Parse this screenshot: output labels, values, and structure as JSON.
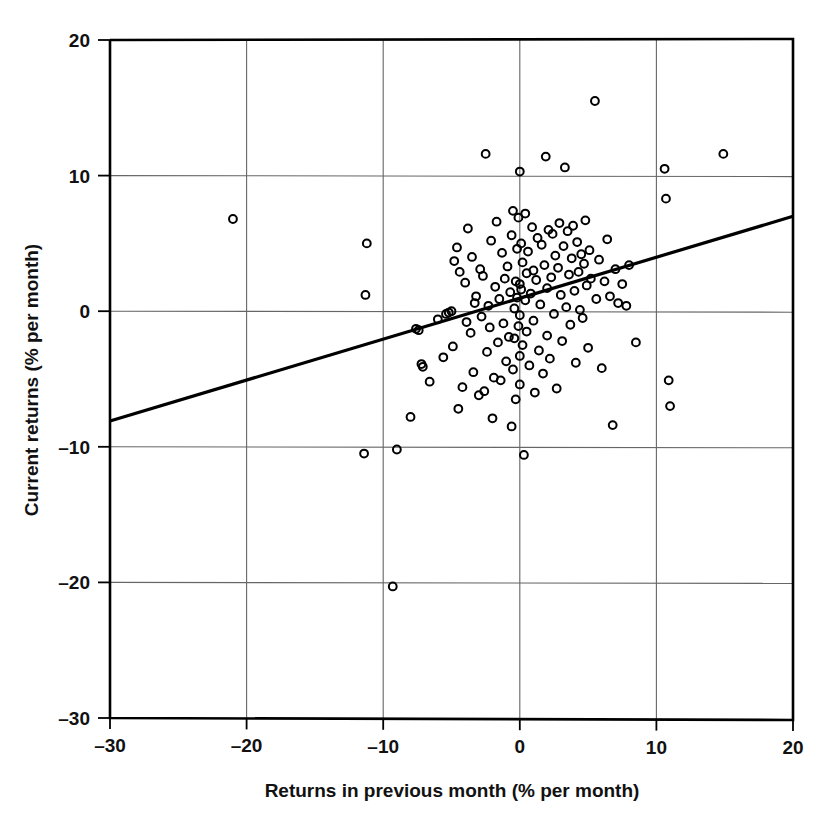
{
  "chart_data": {
    "type": "scatter",
    "title": "",
    "xlabel": "Returns in previous month (% per month)",
    "ylabel": "Current returns (% per month)",
    "xlim": [
      -30,
      20
    ],
    "ylim": [
      -30,
      20
    ],
    "xticks": [
      -30,
      -20,
      -10,
      0,
      10,
      20
    ],
    "yticks": [
      -30,
      -20,
      -10,
      0,
      10,
      20
    ],
    "xtick_labels": [
      "–30",
      "–20",
      "–10",
      "0",
      "10",
      "20"
    ],
    "ytick_labels": [
      "–30",
      "–20",
      "–10",
      "0",
      "10",
      "20"
    ],
    "grid": true,
    "grid_color": "#666666",
    "axis_color": "#000000",
    "marker": "open-circle",
    "marker_color": "#000000",
    "marker_size": 8,
    "legend": "none",
    "series": [
      {
        "name": "Monthly returns",
        "points": [
          [
            -21.0,
            6.8
          ],
          [
            -11.2,
            5.0
          ],
          [
            -11.3,
            1.2
          ],
          [
            -11.4,
            -10.5
          ],
          [
            -9.3,
            -20.3
          ],
          [
            -9.0,
            -10.2
          ],
          [
            -8.0,
            -7.8
          ],
          [
            -7.6,
            -1.3
          ],
          [
            -7.4,
            -1.4
          ],
          [
            -7.2,
            -3.9
          ],
          [
            -7.1,
            -4.1
          ],
          [
            -6.6,
            -5.2
          ],
          [
            -6.0,
            -0.6
          ],
          [
            -5.6,
            -3.4
          ],
          [
            -5.4,
            -0.2
          ],
          [
            -5.2,
            -0.1
          ],
          [
            -5.0,
            0.0
          ],
          [
            -4.9,
            -2.6
          ],
          [
            -4.8,
            3.7
          ],
          [
            -4.6,
            4.7
          ],
          [
            -4.5,
            -7.2
          ],
          [
            -4.4,
            2.9
          ],
          [
            -4.2,
            -5.6
          ],
          [
            -4.0,
            2.1
          ],
          [
            -3.9,
            -0.8
          ],
          [
            -3.8,
            6.1
          ],
          [
            -3.6,
            -1.6
          ],
          [
            -3.5,
            4.0
          ],
          [
            -3.4,
            -4.5
          ],
          [
            -3.3,
            0.6
          ],
          [
            -3.2,
            1.1
          ],
          [
            -3.0,
            -6.2
          ],
          [
            -2.9,
            3.1
          ],
          [
            -2.8,
            -0.4
          ],
          [
            -2.7,
            2.6
          ],
          [
            -2.6,
            -5.9
          ],
          [
            -2.5,
            11.6
          ],
          [
            -2.4,
            -3.0
          ],
          [
            -2.3,
            0.4
          ],
          [
            -2.2,
            -1.2
          ],
          [
            -2.1,
            5.2
          ],
          [
            -2.0,
            -7.9
          ],
          [
            -1.9,
            -4.9
          ],
          [
            -1.8,
            1.8
          ],
          [
            -1.7,
            6.6
          ],
          [
            -1.6,
            -2.3
          ],
          [
            -1.5,
            0.9
          ],
          [
            -1.4,
            -5.1
          ],
          [
            -1.3,
            4.3
          ],
          [
            -1.2,
            -0.9
          ],
          [
            -1.1,
            2.4
          ],
          [
            -1.0,
            -3.7
          ],
          [
            -0.9,
            3.3
          ],
          [
            -0.8,
            -1.9
          ],
          [
            -0.7,
            1.4
          ],
          [
            -0.6,
            5.6
          ],
          [
            -0.6,
            -8.5
          ],
          [
            -0.5,
            -4.3
          ],
          [
            -0.5,
            7.4
          ],
          [
            -0.4,
            0.2
          ],
          [
            -0.4,
            -2.0
          ],
          [
            -0.3,
            2.2
          ],
          [
            -0.3,
            -6.5
          ],
          [
            -0.2,
            1.0
          ],
          [
            -0.2,
            4.6
          ],
          [
            -0.1,
            -1.1
          ],
          [
            -0.1,
            6.9
          ],
          [
            0.0,
            10.3
          ],
          [
            0.0,
            2.0
          ],
          [
            0.0,
            -0.3
          ],
          [
            0.0,
            -3.3
          ],
          [
            0.0,
            -5.4
          ],
          [
            0.1,
            1.6
          ],
          [
            0.1,
            5.0
          ],
          [
            0.2,
            -2.5
          ],
          [
            0.2,
            3.6
          ],
          [
            0.3,
            -10.6
          ],
          [
            0.4,
            0.8
          ],
          [
            0.4,
            7.2
          ],
          [
            0.5,
            -1.5
          ],
          [
            0.5,
            2.8
          ],
          [
            0.6,
            4.4
          ],
          [
            0.7,
            -4.0
          ],
          [
            0.8,
            1.3
          ],
          [
            0.9,
            6.2
          ],
          [
            1.0,
            -0.7
          ],
          [
            1.0,
            3.0
          ],
          [
            1.1,
            -6.0
          ],
          [
            1.2,
            2.3
          ],
          [
            1.3,
            5.4
          ],
          [
            1.4,
            -2.9
          ],
          [
            1.5,
            0.5
          ],
          [
            1.6,
            4.9
          ],
          [
            1.7,
            -4.6
          ],
          [
            1.8,
            3.4
          ],
          [
            1.9,
            11.4
          ],
          [
            2.0,
            1.7
          ],
          [
            2.0,
            -1.8
          ],
          [
            2.1,
            6.0
          ],
          [
            2.2,
            -3.5
          ],
          [
            2.3,
            2.5
          ],
          [
            2.4,
            5.7
          ],
          [
            2.5,
            -0.2
          ],
          [
            2.6,
            4.1
          ],
          [
            2.7,
            -5.7
          ],
          [
            2.8,
            3.2
          ],
          [
            2.9,
            6.5
          ],
          [
            3.0,
            1.2
          ],
          [
            3.1,
            -2.2
          ],
          [
            3.2,
            4.8
          ],
          [
            3.3,
            10.6
          ],
          [
            3.4,
            0.3
          ],
          [
            3.5,
            5.9
          ],
          [
            3.6,
            2.7
          ],
          [
            3.7,
            -1.0
          ],
          [
            3.8,
            3.9
          ],
          [
            3.9,
            6.3
          ],
          [
            4.0,
            1.5
          ],
          [
            4.1,
            -3.8
          ],
          [
            4.2,
            5.1
          ],
          [
            4.3,
            2.9
          ],
          [
            4.4,
            0.1
          ],
          [
            4.5,
            4.2
          ],
          [
            4.6,
            -0.5
          ],
          [
            4.7,
            3.5
          ],
          [
            4.8,
            6.7
          ],
          [
            4.9,
            1.9
          ],
          [
            5.0,
            -2.7
          ],
          [
            5.1,
            4.5
          ],
          [
            5.2,
            2.4
          ],
          [
            5.5,
            15.5
          ],
          [
            5.6,
            0.9
          ],
          [
            5.8,
            3.8
          ],
          [
            6.0,
            -4.2
          ],
          [
            6.2,
            2.2
          ],
          [
            6.4,
            5.3
          ],
          [
            6.6,
            1.1
          ],
          [
            6.8,
            -8.4
          ],
          [
            7.0,
            3.1
          ],
          [
            7.2,
            0.6
          ],
          [
            7.5,
            2.0
          ],
          [
            7.8,
            0.4
          ],
          [
            8.0,
            3.4
          ],
          [
            8.5,
            -2.3
          ],
          [
            10.6,
            10.5
          ],
          [
            10.7,
            8.3
          ],
          [
            10.9,
            -5.1
          ],
          [
            11.0,
            -7.0
          ],
          [
            14.9,
            11.6
          ]
        ]
      }
    ],
    "trendline": {
      "name": "Regression line",
      "x": [
        -30,
        20
      ],
      "y": [
        -8.1,
        7.0
      ],
      "color": "#000000",
      "width": 3.2
    }
  }
}
